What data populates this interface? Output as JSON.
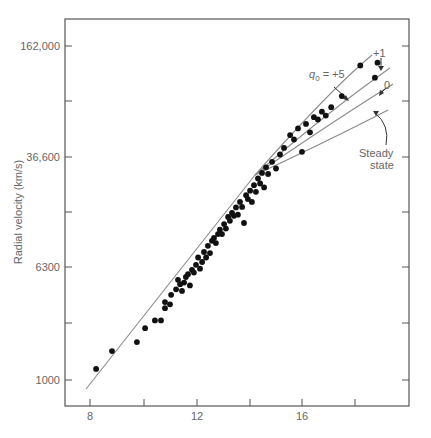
{
  "chart_data": {
    "type": "scatter",
    "title": "",
    "xlabel": "",
    "ylabel": "Radial velocity (km/s)",
    "x_ticks": [
      8,
      10,
      12,
      14,
      16,
      18
    ],
    "x_tick_labels": [
      "8",
      "",
      "12",
      "",
      "16",
      ""
    ],
    "y_ticks": [
      "1000",
      "",
      "6300",
      "",
      "36,600",
      "",
      "162,000"
    ],
    "y_tick_labels": [
      "1000",
      "6300",
      "36,600",
      "162,000"
    ],
    "y_scale": "log (labels at 1000, 6300, 36,600, 162,000)",
    "xlim": [
      7.1,
      20.1
    ],
    "grid": false,
    "points_note": "x in apparent-magnitude units; y as tick-step index (0=1000, 2=6300, 4=36,600, 6=162,000)",
    "points": [
      [
        8.23,
        0.2
      ],
      [
        8.83,
        0.52
      ],
      [
        9.77,
        0.68
      ],
      [
        10.08,
        0.93
      ],
      [
        10.45,
        1.07
      ],
      [
        10.68,
        1.07
      ],
      [
        10.83,
        1.29
      ],
      [
        10.83,
        1.4
      ],
      [
        11.02,
        1.36
      ],
      [
        11.06,
        1.53
      ],
      [
        11.25,
        1.63
      ],
      [
        11.32,
        1.8
      ],
      [
        11.4,
        1.72
      ],
      [
        11.47,
        1.6
      ],
      [
        11.55,
        1.75
      ],
      [
        11.62,
        1.85
      ],
      [
        11.7,
        1.9
      ],
      [
        11.77,
        1.7
      ],
      [
        11.85,
        1.98
      ],
      [
        11.92,
        1.93
      ],
      [
        12.0,
        2.07
      ],
      [
        12.08,
        2.2
      ],
      [
        12.15,
        2.0
      ],
      [
        12.23,
        2.12
      ],
      [
        12.3,
        2.3
      ],
      [
        12.38,
        2.2
      ],
      [
        12.45,
        2.41
      ],
      [
        12.53,
        2.28
      ],
      [
        12.6,
        2.5
      ],
      [
        12.68,
        2.55
      ],
      [
        12.75,
        2.46
      ],
      [
        12.83,
        2.62
      ],
      [
        12.9,
        2.7
      ],
      [
        12.98,
        2.62
      ],
      [
        13.06,
        2.8
      ],
      [
        13.13,
        2.72
      ],
      [
        13.21,
        2.93
      ],
      [
        13.28,
        2.86
      ],
      [
        13.36,
        3.0
      ],
      [
        13.43,
        2.95
      ],
      [
        13.51,
        3.1
      ],
      [
        13.58,
        2.97
      ],
      [
        13.66,
        3.2
      ],
      [
        13.74,
        3.11
      ],
      [
        13.81,
        2.82
      ],
      [
        13.89,
        3.32
      ],
      [
        13.96,
        3.25
      ],
      [
        14.04,
        3.4
      ],
      [
        14.11,
        3.2
      ],
      [
        14.19,
        3.5
      ],
      [
        14.26,
        3.38
      ],
      [
        14.34,
        3.62
      ],
      [
        14.42,
        3.53
      ],
      [
        14.49,
        3.72
      ],
      [
        14.57,
        3.46
      ],
      [
        14.64,
        3.82
      ],
      [
        14.72,
        3.7
      ],
      [
        14.87,
        3.92
      ],
      [
        15.02,
        3.8
      ],
      [
        15.17,
        4.05
      ],
      [
        15.32,
        4.17
      ],
      [
        15.55,
        4.4
      ],
      [
        15.7,
        4.32
      ],
      [
        15.85,
        4.52
      ],
      [
        16.0,
        4.1
      ],
      [
        16.15,
        4.6
      ],
      [
        16.3,
        4.45
      ],
      [
        16.45,
        4.72
      ],
      [
        16.6,
        4.68
      ],
      [
        16.75,
        4.82
      ],
      [
        16.9,
        4.75
      ],
      [
        17.1,
        4.9
      ],
      [
        17.5,
        5.1
      ],
      [
        18.2,
        5.65
      ],
      [
        18.75,
        5.43
      ],
      [
        18.85,
        5.7
      ]
    ],
    "series": [
      {
        "name": "q0 = +5",
        "label": "q₀ = +5"
      },
      {
        "name": "+1",
        "label": "+1"
      },
      {
        "name": "0",
        "label": "0"
      },
      {
        "name": "Steady state",
        "label": "Steady state"
      }
    ],
    "annotations": [
      "q₀ = +5",
      "+1",
      "0",
      "Steady",
      "state"
    ]
  },
  "labels": {
    "y_axis_title": "Radial velocity (km/s)",
    "y_162000": "162,000",
    "y_36600": "36,600",
    "y_6300": "6300",
    "y_1000": "1000",
    "x_8": "8",
    "x_12": "12",
    "x_16": "16",
    "ann_q0_prefix": "q",
    "ann_q0_sub": "0",
    "ann_q0_suffix": " = +5",
    "ann_plus1": "+1",
    "ann_zero": "0",
    "ann_steady1": "Steady",
    "ann_steady2": "state"
  },
  "colors": {
    "axis": "#555555",
    "curve": "#8a8a8a",
    "point": "#111111",
    "text": "#666666"
  }
}
